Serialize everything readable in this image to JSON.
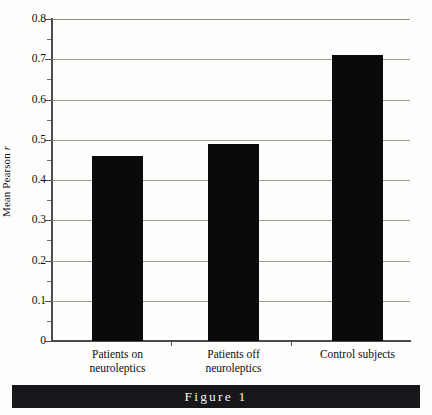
{
  "chart_data": {
    "type": "bar",
    "title": "",
    "xlabel": "",
    "ylabel": "Mean Pearson r",
    "ylabel_parts": {
      "prefix": "Mean Pearson ",
      "italic": "r"
    },
    "categories": [
      "Patients on neuroleptics",
      "Patients off neuroleptics",
      "Control subjects"
    ],
    "category_lines": [
      {
        "line1": "Patients on",
        "line2": "neuroleptics"
      },
      {
        "line1": "Patients off",
        "line2": "neuroleptics"
      },
      {
        "line1": "Control subjects",
        "line2": ""
      }
    ],
    "values": [
      0.46,
      0.49,
      0.71
    ],
    "ylim": [
      0,
      0.8
    ],
    "ytick_labels": [
      "0.8",
      "0.7",
      "0.6",
      "0.5",
      "0.4",
      "0.3",
      "0.2",
      "0.1",
      "0"
    ],
    "ytick_values": [
      0.8,
      0.7,
      0.6,
      0.5,
      0.4,
      0.3,
      0.2,
      0.1,
      0
    ],
    "minor_tick_values": [
      0.75,
      0.65,
      0.55,
      0.45,
      0.35,
      0.25,
      0.15,
      0.05
    ],
    "grid": true,
    "grid_axis": "y",
    "legend": "none",
    "bar_color": "#0b0a0a",
    "grid_color": "#9a9a96",
    "axis_color": "#4a4a48"
  },
  "caption": {
    "label": "Figure 1",
    "bar_color": "#17161a",
    "text_color": "#f2f1ef"
  }
}
